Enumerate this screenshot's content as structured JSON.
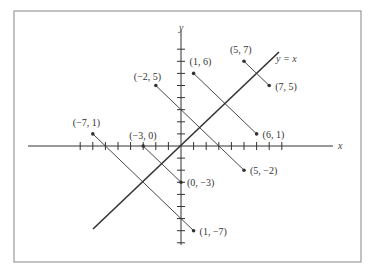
{
  "figure": {
    "x_axis_label": "x",
    "y_axis_label": "y",
    "line_label": "y = x",
    "x_ticks": [
      -8,
      -7,
      -6,
      -5,
      -4,
      -3,
      -2,
      -1,
      1,
      2,
      3,
      4,
      5,
      6,
      7,
      8
    ],
    "y_ticks": [
      -8,
      -7,
      -6,
      -5,
      -4,
      -3,
      -2,
      -1,
      1,
      2,
      3,
      4,
      5,
      6,
      7,
      8
    ],
    "reflections": [
      {
        "from": {
          "x": 5,
          "y": 7,
          "label": "(5, 7)"
        },
        "to": {
          "x": 7,
          "y": 5,
          "label": "(7, 5)"
        }
      },
      {
        "from": {
          "x": 1,
          "y": 6,
          "label": "(1, 6)"
        },
        "to": {
          "x": 6,
          "y": 1,
          "label": "(6, 1)"
        }
      },
      {
        "from": {
          "x": -2,
          "y": 5,
          "label": "(−2, 5)"
        },
        "to": {
          "x": 5,
          "y": -2,
          "label": "(5, −2)"
        }
      },
      {
        "from": {
          "x": -7,
          "y": 1,
          "label": "(−7, 1)"
        },
        "to": {
          "x": 1,
          "y": -7,
          "label": "(1, −7)"
        }
      },
      {
        "from": {
          "x": -3,
          "y": 0,
          "label": "(−3, 0)"
        },
        "to": {
          "x": 0,
          "y": -3,
          "label": "(0, −3)"
        }
      }
    ],
    "colors": {
      "ink": "#333333",
      "frame": "#999999",
      "background": "#ffffff"
    }
  }
}
